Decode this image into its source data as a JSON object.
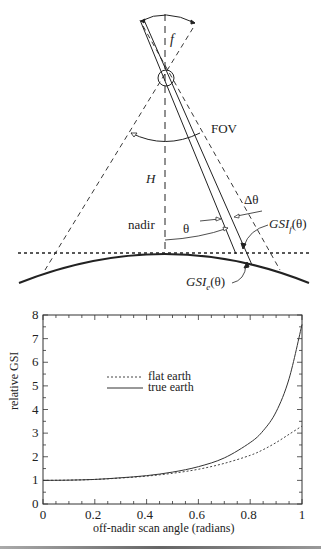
{
  "diagram": {
    "labels": {
      "focal": "f",
      "fov": "FOV",
      "height": "H",
      "nadir": "nadir",
      "theta": "θ",
      "delta_theta": "Δθ",
      "gsi_flat": "GSI",
      "gsi_flat_sub": "f",
      "gsi_flat_arg": "(θ)",
      "gsi_earth": "GSI",
      "gsi_earth_sub": "e",
      "gsi_earth_arg": "(θ)"
    }
  },
  "chart_data": {
    "type": "line",
    "title": "",
    "xlabel": "off-nadir scan angle (radians)",
    "ylabel": "relative GSI",
    "xlim": [
      0,
      1
    ],
    "ylim": [
      0,
      8
    ],
    "xticks": [
      "0",
      "0.2",
      "0.4",
      "0.6",
      "0.8",
      "1"
    ],
    "yticks": [
      "0",
      "1",
      "2",
      "3",
      "4",
      "5",
      "6",
      "7",
      "8"
    ],
    "grid": false,
    "legend_position": "upper-left-center",
    "x": [
      0,
      0.1,
      0.2,
      0.3,
      0.4,
      0.5,
      0.6,
      0.7,
      0.8,
      0.85,
      0.9,
      0.95,
      1.0
    ],
    "series": [
      {
        "name": "flat earth",
        "style": "dotted",
        "values": [
          1.0,
          1.01,
          1.04,
          1.1,
          1.18,
          1.3,
          1.47,
          1.72,
          2.06,
          2.3,
          2.6,
          2.95,
          3.3
        ]
      },
      {
        "name": "true earth",
        "style": "solid",
        "values": [
          1.0,
          1.01,
          1.04,
          1.11,
          1.2,
          1.35,
          1.58,
          1.95,
          2.6,
          3.1,
          3.9,
          5.3,
          7.6
        ]
      }
    ]
  }
}
